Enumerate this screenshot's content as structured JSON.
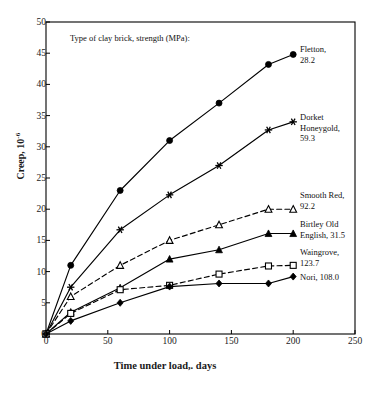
{
  "chart_data": {
    "type": "line",
    "title": "Type of clay brick, strength (MPa):",
    "xlabel": "Time under load,. days",
    "ylabel_text": "Creep, 10",
    "ylabel_exponent": "-6",
    "xlim": [
      0,
      250
    ],
    "ylim": [
      0,
      50
    ],
    "xticks": [
      0,
      50,
      100,
      150,
      200,
      250
    ],
    "yticks": [
      0,
      5,
      10,
      15,
      20,
      25,
      30,
      35,
      40,
      45,
      50
    ],
    "grid": false,
    "legend_position": "right-inline",
    "x": [
      0,
      20,
      60,
      100,
      140,
      180,
      200
    ],
    "series": [
      {
        "name": "Fletton, 28.2",
        "label_lines": [
          "Fletton,",
          "28.2"
        ],
        "marker": "filled-circle",
        "line_style": "solid",
        "color": "#000000",
        "values": [
          0,
          11.0,
          23.0,
          31.0,
          37.0,
          43.2,
          44.8
        ]
      },
      {
        "name": "Dorket Honeygold, 59.3",
        "label_lines": [
          "Dorket",
          "Honeygold,",
          "59.3"
        ],
        "marker": "star",
        "line_style": "solid",
        "color": "#000000",
        "values": [
          0,
          7.5,
          16.7,
          22.3,
          27.0,
          32.7,
          34.0
        ]
      },
      {
        "name": "Smooth Red, 92.2",
        "label_lines": [
          "Smooth Red,",
          "92.2"
        ],
        "marker": "open-triangle",
        "line_style": "dashed",
        "color": "#000000",
        "values": [
          0,
          6.0,
          11.0,
          15.0,
          17.5,
          20.0,
          20.0
        ]
      },
      {
        "name": "Birtley Old English, 31.5",
        "label_lines": [
          "Birtley Old",
          "English, 31.5"
        ],
        "marker": "filled-triangle",
        "line_style": "solid",
        "color": "#000000",
        "values": [
          0,
          3.5,
          7.4,
          12.0,
          13.5,
          16.1,
          16.1
        ]
      },
      {
        "name": "Waingrove, 123.7",
        "label_lines": [
          "Waingrove,",
          "123.7"
        ],
        "marker": "open-square",
        "line_style": "dashed",
        "color": "#000000",
        "values": [
          0,
          3.3,
          7.1,
          7.8,
          9.6,
          10.9,
          11.0
        ]
      },
      {
        "name": "Nori, 108.0",
        "label_lines": [
          "Nori, 108.0"
        ],
        "marker": "filled-diamond",
        "line_style": "solid",
        "color": "#000000",
        "values": [
          0,
          2.1,
          5.0,
          7.6,
          8.1,
          8.1,
          9.2
        ]
      }
    ]
  },
  "axis": {
    "frame_color": "#000000",
    "background": "#ffffff"
  }
}
